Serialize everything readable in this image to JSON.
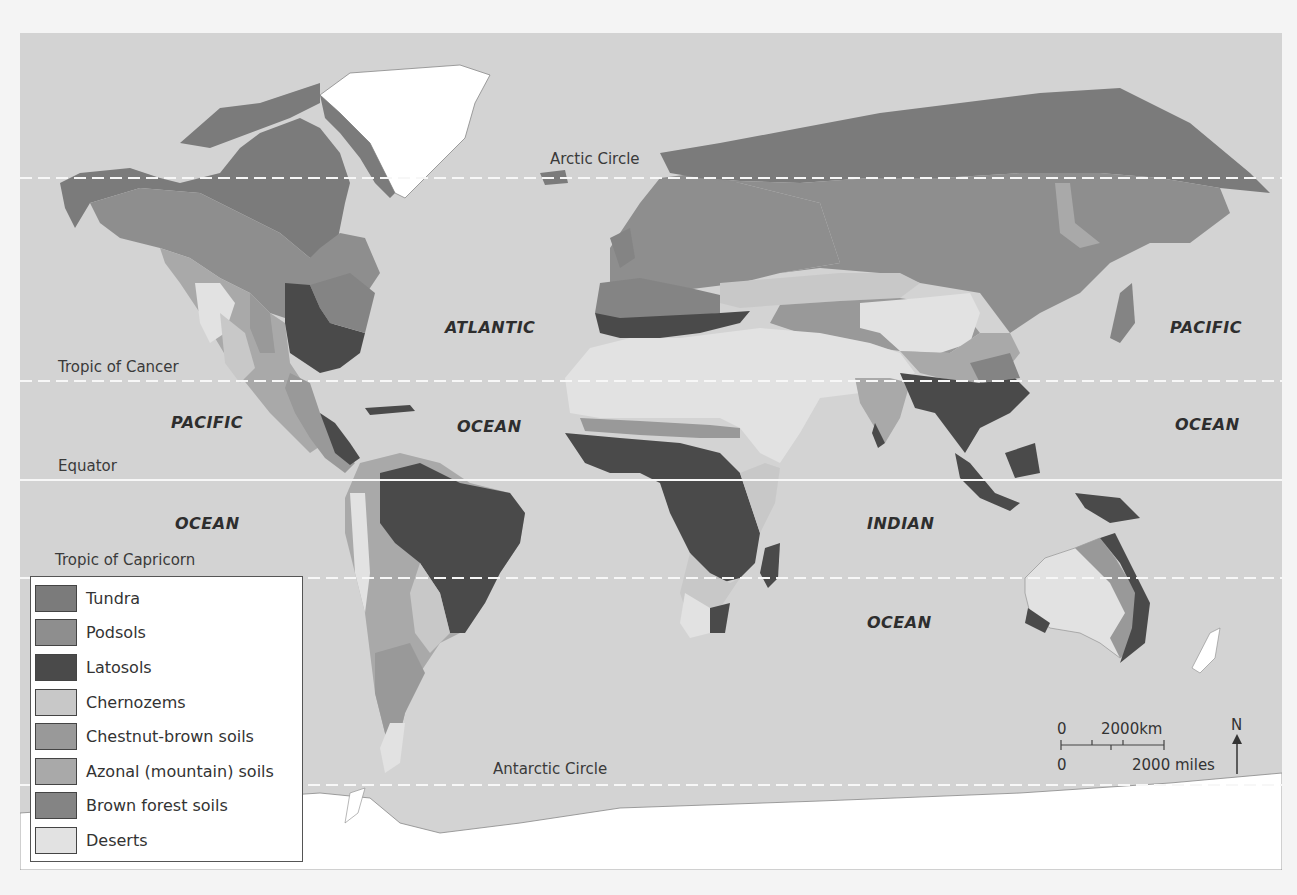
{
  "map": {
    "title": "World soil types",
    "ocean_color": "#d3d3d3",
    "latitude_lines": [
      {
        "label": "Arctic Circle",
        "y": 145,
        "style": "dashed"
      },
      {
        "label": "Tropic of Cancer",
        "y": 348,
        "style": "dashed"
      },
      {
        "label": "Equator",
        "y": 447,
        "style": "solid"
      },
      {
        "label": "Tropic of Capricorn",
        "y": 545,
        "style": "dashed"
      },
      {
        "label": "Antarctic Circle",
        "y": 752,
        "style": "dashed"
      }
    ],
    "oceans": {
      "pacific_west_1": "PACIFIC",
      "pacific_west_2": "OCEAN",
      "atlantic_1": "ATLANTIC",
      "atlantic_2": "OCEAN",
      "indian_1": "INDIAN",
      "indian_2": "OCEAN",
      "pacific_east_1": "PACIFIC",
      "pacific_east_2": "OCEAN"
    }
  },
  "legend": {
    "items": [
      {
        "label": "Tundra",
        "color": "#7b7b7b"
      },
      {
        "label": "Podsols",
        "color": "#8e8e8e"
      },
      {
        "label": "Latosols",
        "color": "#4a4a4a"
      },
      {
        "label": "Chernozems",
        "color": "#c8c8c8"
      },
      {
        "label": "Chestnut-brown soils",
        "color": "#999999"
      },
      {
        "label": "Azonal (mountain) soils",
        "color": "#a9a9a9"
      },
      {
        "label": "Brown forest soils",
        "color": "#848484"
      },
      {
        "label": "Deserts",
        "color": "#e2e2e2"
      }
    ]
  },
  "scale_bar": {
    "km_zero": "0",
    "km_label": "2000km",
    "miles_zero": "0",
    "miles_label": "2000 miles",
    "north_label": "N"
  }
}
